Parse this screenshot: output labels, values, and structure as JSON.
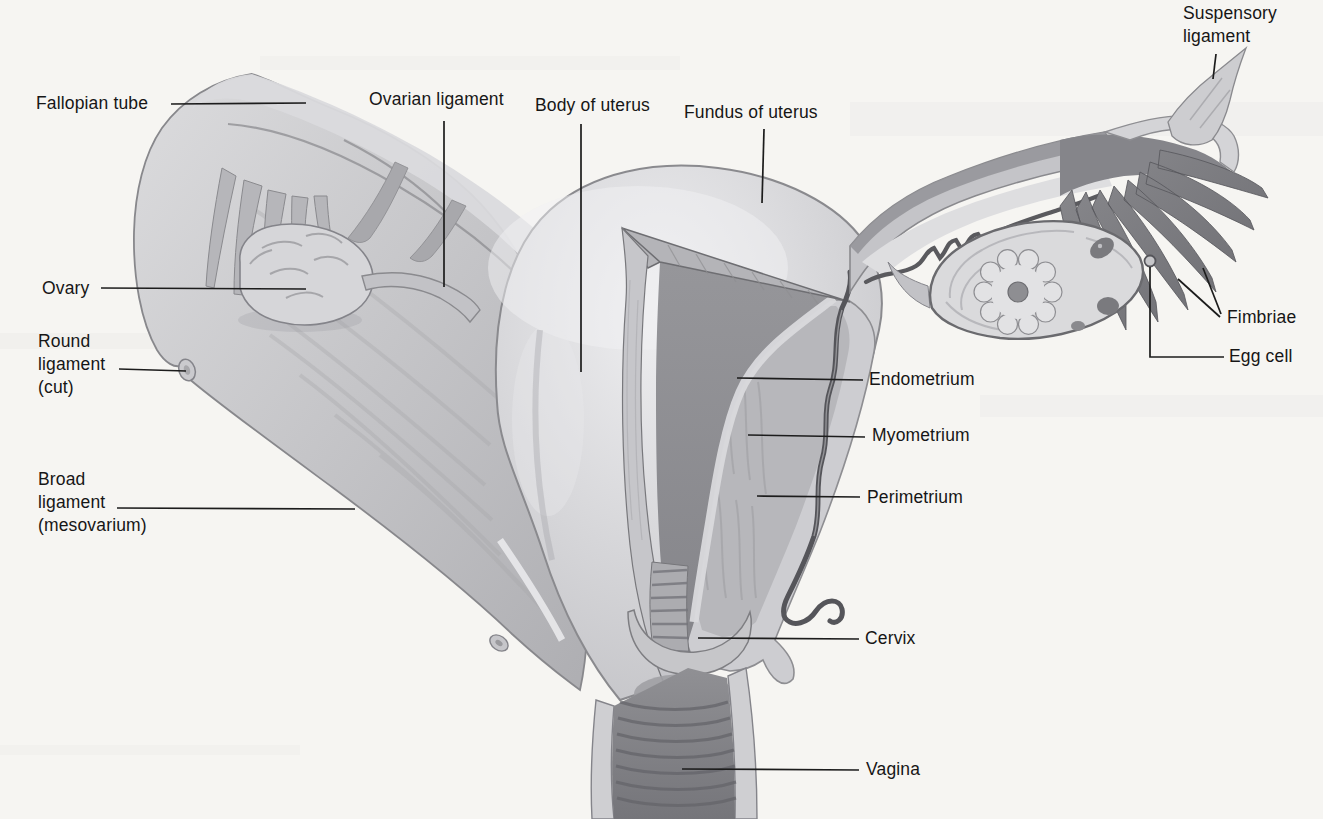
{
  "labels": {
    "fallopian_tube": "Fallopian tube",
    "ovarian_ligament": "Ovarian ligament",
    "body_of_uterus": "Body of uterus",
    "fundus_of_uterus": "Fundus of uterus",
    "suspensory_ligament": "Suspensory\nligament",
    "ovary": "Ovary",
    "round_ligament": "Round\nligament\n(cut)",
    "broad_ligament": "Broad\nligament\n(mesovarium)",
    "fimbriae": "Fimbriae",
    "egg_cell": "Egg cell",
    "endometrium": "Endometrium",
    "myometrium": "Myometrium",
    "perimetrium": "Perimetrium",
    "cervix": "Cervix",
    "vagina": "Vagina"
  },
  "palette": {
    "background": "#f6f5f2",
    "leader_line": "#1c1c1c",
    "tissue_light": "#dcdcde",
    "tissue_mid": "#b6b6ba",
    "tissue_dark": "#8a8a8e",
    "fimbriae_dark": "#76767c",
    "cavity": "#909094"
  }
}
